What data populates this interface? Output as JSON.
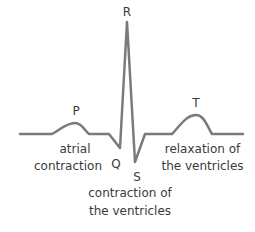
{
  "diagram": {
    "title": "",
    "waves": {
      "P": "P",
      "Q": "Q",
      "R": "R",
      "S": "S",
      "T": "T"
    },
    "annotations": {
      "atrial_line1": "atrial",
      "atrial_line2": "contraction",
      "ventricular_contraction_line1": "contraction of",
      "ventricular_contraction_line2": "the ventricles",
      "ventricular_relaxation_line1": "relaxation of",
      "ventricular_relaxation_line2": "the ventricles"
    },
    "colors": {
      "trace": "#7a7a7a",
      "text": "#3a3a3a",
      "background": "#ffffff"
    }
  }
}
